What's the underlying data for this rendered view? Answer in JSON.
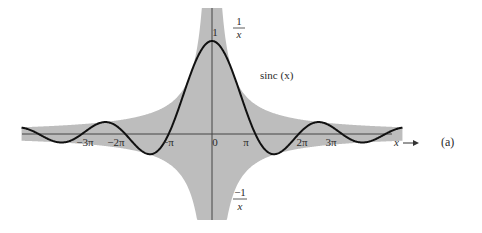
{
  "chart_data": {
    "type": "line",
    "title": "",
    "panel_label": "(a)",
    "xlabel": "x",
    "ylabel": "",
    "x_range": [
      -13.8,
      13.8
    ],
    "y_range": [
      -1,
      1
    ],
    "grid": false,
    "legend": "none",
    "x_ticks": [
      "-3π",
      "-2π",
      "-π",
      "0",
      "π",
      "2π",
      "3π"
    ],
    "x_tick_values": [
      -9.4248,
      -6.2832,
      -3.1416,
      0,
      3.1416,
      6.2832,
      9.4248
    ],
    "y_tick_label": "1",
    "series": [
      {
        "name": "sinc (x)",
        "function": "sin(x)/x",
        "style": "solid black curve"
      }
    ],
    "envelope": {
      "upper": "1/x",
      "lower": "-1/x",
      "style": "gray shaded region between +1/|x| and -1/|x|"
    },
    "annotations": [
      "1/x",
      "-1/x",
      "sinc (x)",
      "1",
      "x →",
      "(a)"
    ]
  },
  "labels": {
    "upper_env_num": "1",
    "upper_env_den": "x",
    "lower_env_num": "−1",
    "lower_env_den": "x",
    "curve": "sinc (x)",
    "peak": "1",
    "x_axis": "x",
    "panel": "(a)",
    "ticks": [
      "−3π",
      "−2π",
      "−π",
      "0",
      "π",
      "2π",
      "3π"
    ]
  },
  "colors": {
    "shade": "#bdbdbd",
    "curve": "#111111",
    "axis": "#444444"
  }
}
